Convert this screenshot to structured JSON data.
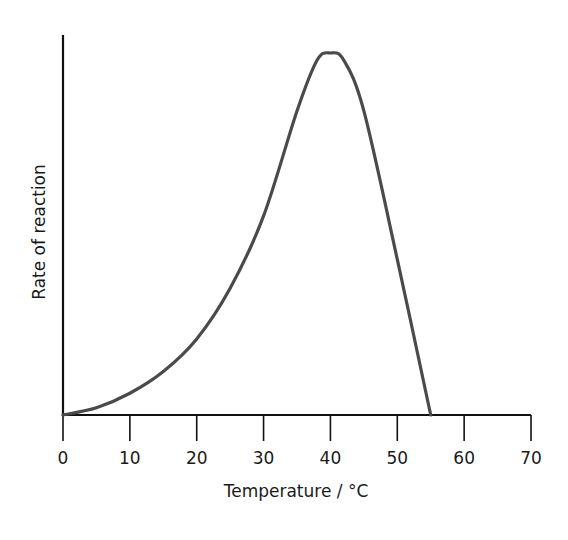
{
  "chart_data": {
    "type": "line",
    "title": "",
    "xlabel": "Temperature / °C",
    "ylabel": "Rate of reaction",
    "x_ticks": [
      0,
      10,
      20,
      30,
      40,
      50,
      60,
      70
    ],
    "x_tick_labels": [
      "0",
      "10",
      "20",
      "30",
      "40",
      "50",
      "60",
      "70"
    ],
    "y_ticks": [],
    "xlim": [
      0,
      70
    ],
    "ylim": [
      0,
      105
    ],
    "grid": false,
    "legend": null,
    "series": [
      {
        "name": "Rate of reaction",
        "color": "#4a4a4a",
        "x": [
          0,
          5,
          10,
          15,
          20,
          25,
          30,
          35,
          38,
          40,
          42,
          45,
          50,
          55
        ],
        "y": [
          0,
          2,
          6,
          12,
          21,
          35,
          55,
          84,
          98,
          100,
          98,
          84,
          43,
          0
        ]
      }
    ],
    "annotations": [
      "Peak (optimum) at about 40 °C",
      "Rate falls to zero at about 55 °C"
    ]
  },
  "axes": {
    "x_title": "Temperature / °C",
    "y_title": "Rate of reaction"
  }
}
